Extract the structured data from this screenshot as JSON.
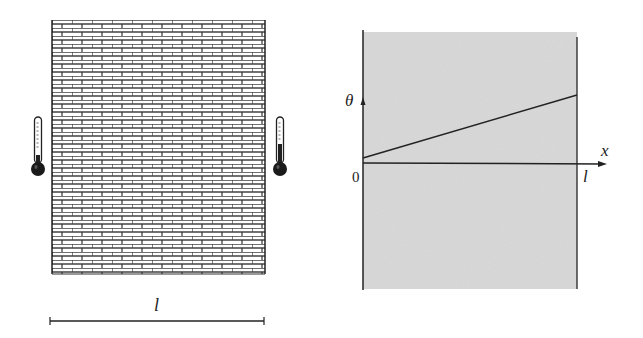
{
  "figure": {
    "left_panel": {
      "description": "brick wall of thickness l with thermometers on each side",
      "wall_length_label": "l",
      "thermometers": [
        {
          "side": "left",
          "icon": "thermometer-icon",
          "level": "low"
        },
        {
          "side": "right",
          "icon": "thermometer-icon",
          "level": "high"
        }
      ]
    },
    "right_panel": {
      "description": "temperature profile theta(x) across wall of thickness l",
      "y_axis_label": "θ",
      "x_axis_label": "x",
      "origin_label": "0",
      "end_label": "l",
      "profile": {
        "type": "line",
        "from": [
          0,
          0.1
        ],
        "to": [
          1,
          0.9
        ],
        "note": "linear increase of θ from x=0 to x=l"
      }
    },
    "colors": {
      "ink": "#222222",
      "shade": "#d6d6d6",
      "brick_fill": "#ffffff"
    }
  }
}
